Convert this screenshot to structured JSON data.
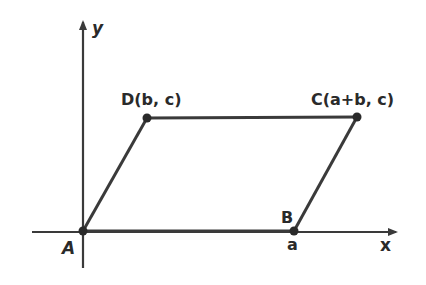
{
  "figure": {
    "type": "parallelogram-on-axes",
    "stroke_color": "#3a3a3a",
    "axes": {
      "x_label": "x",
      "y_label": "y"
    },
    "points": [
      {
        "id": "A",
        "label": "A",
        "coord_label": ""
      },
      {
        "id": "B",
        "label": "B",
        "coord_label": "a"
      },
      {
        "id": "C",
        "label": "C(a+b, c)",
        "coord_label": ""
      },
      {
        "id": "D",
        "label": "D(b, c)",
        "coord_label": ""
      }
    ],
    "sides": [
      "AB",
      "BC",
      "CD",
      "DA"
    ]
  }
}
